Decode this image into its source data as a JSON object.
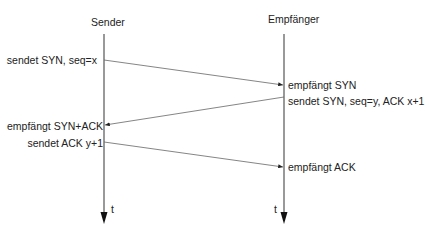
{
  "participants": [
    {
      "name": "Sender",
      "x": 104
    },
    {
      "name": "Empfänger",
      "x": 284
    }
  ],
  "time_label": "t",
  "sender_events": [
    {
      "label": "sendet SYN, seq=x",
      "y": 60
    },
    {
      "label": "empfängt SYN+ACK",
      "y": 125
    },
    {
      "label": "sendet ACK y+1",
      "y": 142
    }
  ],
  "receiver_events": [
    {
      "label": "empfängt SYN",
      "y": 85
    },
    {
      "label": "sendet SYN, seq=y, ACK x+1",
      "y": 100
    },
    {
      "label": "empfängt ACK",
      "y": 167
    }
  ],
  "messages": [
    {
      "from": "Sender",
      "to": "Empfänger",
      "y_start": 60,
      "y_end": 85,
      "content": "SYN, seq=x"
    },
    {
      "from": "Empfänger",
      "to": "Sender",
      "y_start": 97,
      "y_end": 125,
      "content": "SYN, seq=y, ACK x+1"
    },
    {
      "from": "Sender",
      "to": "Empfänger",
      "y_start": 142,
      "y_end": 167,
      "content": "ACK y+1"
    }
  ],
  "colors": {
    "line": "#555555",
    "arrow": "#222222",
    "text": "#222222"
  }
}
